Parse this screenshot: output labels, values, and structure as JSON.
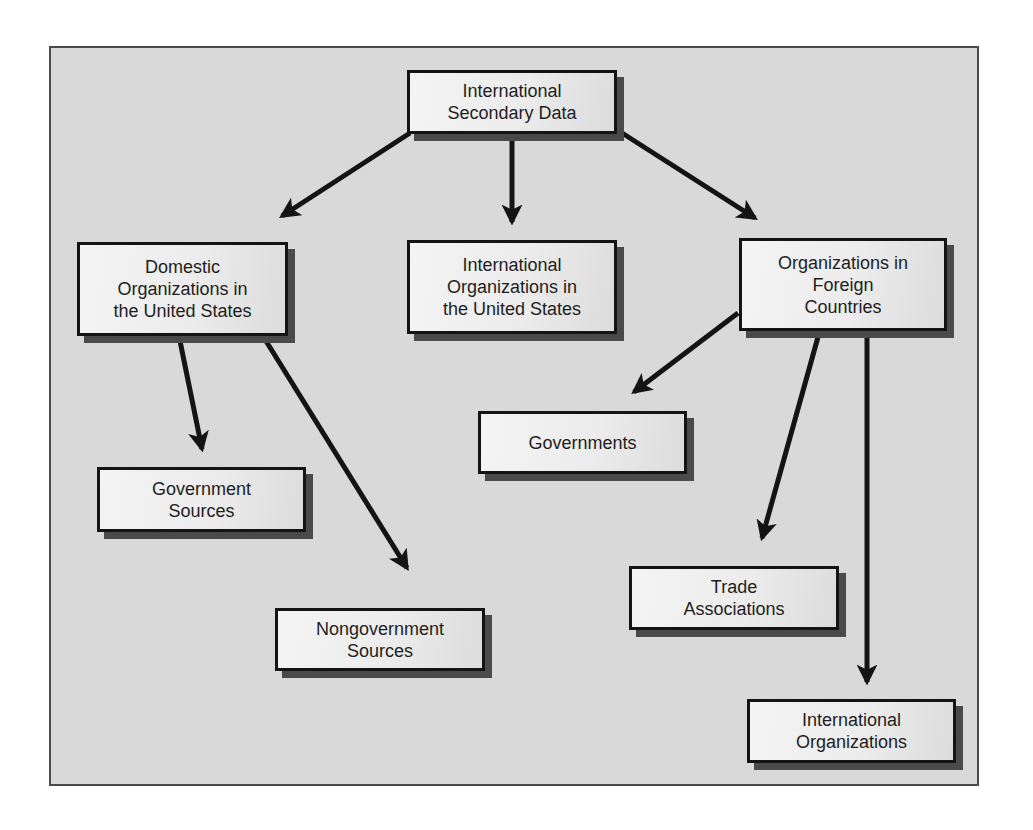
{
  "diagram": {
    "type": "hierarchy",
    "colors": {
      "panel_background": "#d9d9d9",
      "box_fill": "#ececec",
      "box_border": "#141414",
      "box_shadow": "#4a4a4a",
      "arrow": "#141414",
      "text": "#1e1e1e"
    },
    "nodes": {
      "root": {
        "label": "International\nSecondary Data"
      },
      "domestic": {
        "label": "Domestic\nOrganizations in\nthe United States"
      },
      "intl_us": {
        "label": "International\nOrganizations in\nthe United States"
      },
      "foreign": {
        "label": "Organizations in\nForeign\nCountries"
      },
      "gov_sources": {
        "label": "Government\nSources"
      },
      "nongov_sources": {
        "label": "Nongovernment\nSources"
      },
      "governments": {
        "label": "Governments"
      },
      "trade": {
        "label": "Trade\nAssociations"
      },
      "intl_orgs": {
        "label": "International\nOrganizations"
      }
    },
    "edges": [
      {
        "from": "root",
        "to": "domestic"
      },
      {
        "from": "root",
        "to": "intl_us"
      },
      {
        "from": "root",
        "to": "foreign"
      },
      {
        "from": "domestic",
        "to": "gov_sources"
      },
      {
        "from": "domestic",
        "to": "nongov_sources"
      },
      {
        "from": "foreign",
        "to": "governments"
      },
      {
        "from": "foreign",
        "to": "trade"
      },
      {
        "from": "foreign",
        "to": "intl_orgs"
      }
    ]
  }
}
